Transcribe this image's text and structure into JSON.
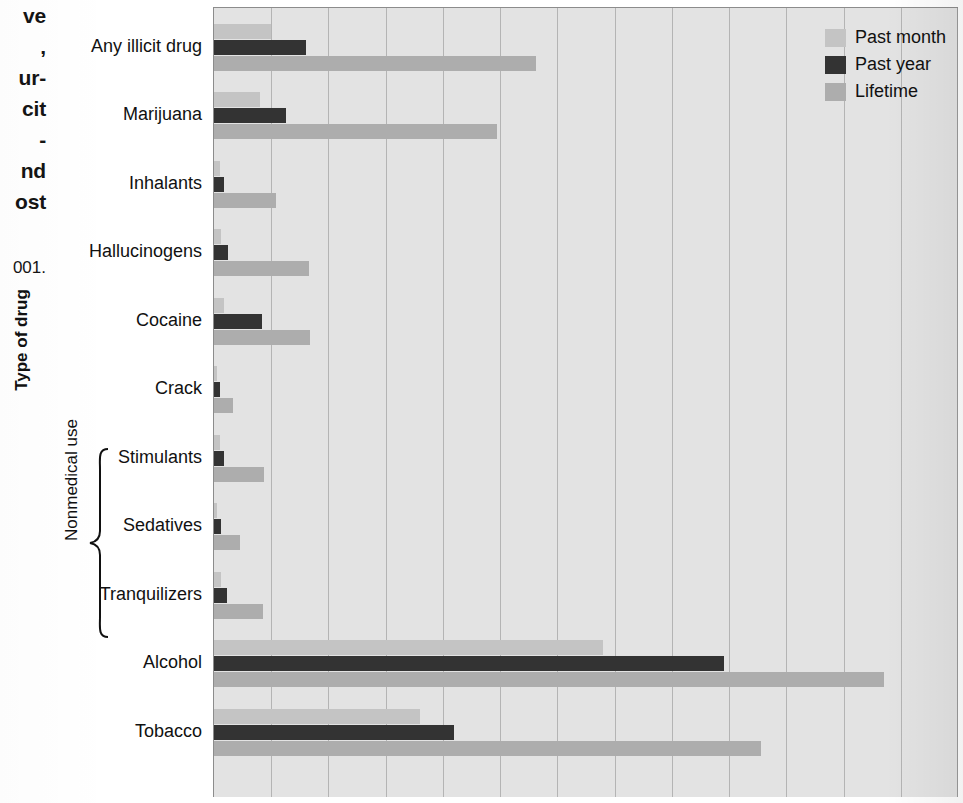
{
  "caption": {
    "fragment_lines": "ve\n,\nur-\ncit\n-\nnd\nost",
    "source_fragment": "001."
  },
  "axes": {
    "y_title": "Type of drug",
    "bracket_label": "Nonmedical use",
    "bracket_icon": "curly-brace-icon"
  },
  "legend": {
    "items": [
      {
        "key": "past_month",
        "label": "Past month",
        "color": "#c4c4c4"
      },
      {
        "key": "past_year",
        "label": "Past year",
        "color": "#333333"
      },
      {
        "key": "lifetime",
        "label": "Lifetime",
        "color": "#adadad"
      }
    ]
  },
  "chart_data": {
    "type": "bar",
    "orientation": "horizontal",
    "title": "",
    "xlabel": "",
    "ylabel": "Type of drug",
    "xlim": [
      0,
      65
    ],
    "grid": true,
    "gridline_step": 5,
    "legend_position": "top-right",
    "categories": [
      "Any illicit drug",
      "Marijuana",
      "Inhalants",
      "Hallucinogens",
      "Cocaine",
      "Crack",
      "Stimulants",
      "Sedatives",
      "Tranquilizers",
      "Alcohol",
      "Tobacco"
    ],
    "grouped_categories": {
      "label": "Nonmedical use",
      "members": [
        "Stimulants",
        "Sedatives",
        "Tranquilizers"
      ]
    },
    "series": [
      {
        "name": "Past month",
        "key": "past_month",
        "color": "#c4c4c4",
        "values": [
          5.0,
          4.0,
          0.5,
          0.6,
          0.9,
          0.3,
          0.5,
          0.3,
          0.6,
          34.0,
          18.0
        ]
      },
      {
        "name": "Past year",
        "key": "past_year",
        "color": "#333333",
        "values": [
          8.0,
          6.3,
          0.9,
          1.2,
          4.2,
          0.5,
          0.9,
          0.6,
          1.1,
          44.6,
          21.0
        ]
      },
      {
        "name": "Lifetime",
        "key": "lifetime",
        "color": "#adadad",
        "values": [
          28.1,
          24.7,
          5.4,
          8.3,
          8.4,
          1.7,
          4.4,
          2.3,
          4.3,
          58.5,
          47.8
        ]
      }
    ]
  }
}
